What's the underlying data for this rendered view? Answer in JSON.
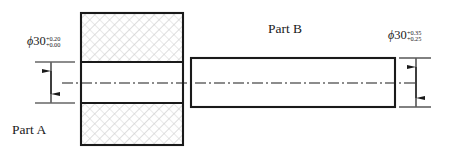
{
  "drawing": {
    "title": "Mating parts fit tolerance drawing",
    "background_color": "#ffffff",
    "line_color": "#1a1a1a",
    "hatch_color": "#b8b8b8"
  },
  "part_a": {
    "label": "Part A",
    "role": "hole",
    "hatched": true,
    "dimension": {
      "symbol": "ϕ",
      "nominal": "30",
      "upper_tolerance": "+0.20",
      "lower_tolerance": "+0.00",
      "full_text": "ϕ30 +0.20 / +0.00"
    }
  },
  "part_b": {
    "label": "Part B",
    "role": "shaft",
    "hatched": false,
    "dimension": {
      "symbol": "ϕ",
      "nominal": "30",
      "upper_tolerance": "+0.35",
      "lower_tolerance": "+0.25",
      "full_text": "ϕ30 +0.35 / +0.25"
    }
  },
  "centerline": {
    "style": "dash-dot",
    "orientation": "horizontal"
  }
}
